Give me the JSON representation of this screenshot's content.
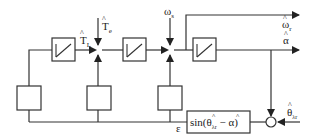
{
  "diagram": {
    "type": "block-diagram",
    "title": "",
    "colors": {
      "stroke": "#333333",
      "background": "#ffffff"
    },
    "signals": {
      "torque_load": {
        "symbol": "T",
        "hat": "^",
        "subscript": "L"
      },
      "torque_electric": {
        "symbol": "T",
        "hat": "^",
        "subscript": "e"
      },
      "omega_s": {
        "symbol": "ω",
        "subscript": "s"
      },
      "omega_r": {
        "symbol": "ω",
        "hat": "^",
        "subscript": "r"
      },
      "alpha": {
        "symbol": "α",
        "hat": "^"
      },
      "theta_input": {
        "symbol": "θ",
        "hat": "^",
        "subscript": "λr"
      },
      "epsilon": {
        "symbol": "ε"
      }
    },
    "blocks": [
      {
        "id": "integrator-1",
        "kind": "integrator",
        "glyph": "ramp"
      },
      {
        "id": "integrator-2",
        "kind": "integrator",
        "glyph": "ramp"
      },
      {
        "id": "integrator-3",
        "kind": "integrator",
        "glyph": "ramp"
      },
      {
        "id": "gain-1",
        "kind": "gain",
        "label": ""
      },
      {
        "id": "gain-2",
        "kind": "gain",
        "label": ""
      },
      {
        "id": "gain-3",
        "kind": "gain",
        "label": ""
      },
      {
        "id": "error-function",
        "kind": "function",
        "label": "sin(θ̂λr − α̂)"
      }
    ],
    "junctions": [
      {
        "id": "sum-1",
        "inputs": [
          "T̂L",
          "T̂e",
          "gain-2"
        ]
      },
      {
        "id": "sum-2",
        "inputs": [
          "ωs",
          "gain-3"
        ]
      },
      {
        "id": "sum-circle",
        "inputs": [
          "θ̂λr",
          "α̂"
        ]
      }
    ],
    "labels": {
      "tl_main": "T",
      "tl_sub": "L",
      "te_main": "T",
      "te_sub": "e",
      "ws_main": "ω",
      "ws_sub": "s",
      "wr_main": "ω",
      "wr_sub": "r",
      "alpha_main": "α",
      "theta_main": "θ",
      "theta_sub": "λr",
      "eps": "ε",
      "sin_prefix": "sin(",
      "sin_theta": "θ",
      "sin_theta_sub": "λr",
      "sin_minus": " − ",
      "sin_alpha": "α",
      "sin_close": ")",
      "hat": "^"
    }
  }
}
